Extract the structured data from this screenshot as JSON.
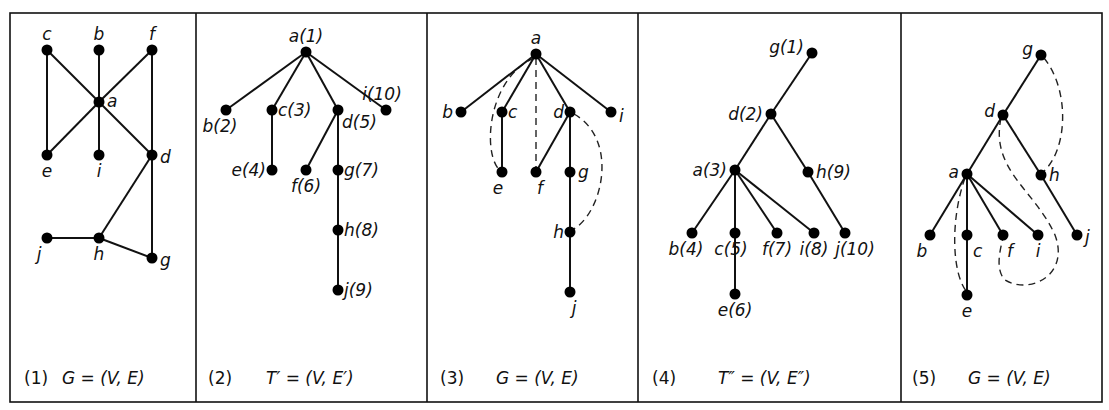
{
  "figure": {
    "panels": [
      {
        "id": "p1",
        "number": "(1)",
        "caption": "G = (V, E)",
        "type": "graph",
        "nodes": [
          {
            "id": "c",
            "label": "c",
            "x": 47,
            "y": 50
          },
          {
            "id": "b",
            "label": "b",
            "x": 99,
            "y": 50
          },
          {
            "id": "f",
            "label": "f",
            "x": 152,
            "y": 50
          },
          {
            "id": "a",
            "label": "a",
            "x": 99,
            "y": 102
          },
          {
            "id": "e",
            "label": "e",
            "x": 47,
            "y": 155
          },
          {
            "id": "i",
            "label": "i",
            "x": 99,
            "y": 155
          },
          {
            "id": "d",
            "label": "d",
            "x": 152,
            "y": 155
          },
          {
            "id": "j",
            "label": "j",
            "x": 47,
            "y": 238
          },
          {
            "id": "h",
            "label": "h",
            "x": 99,
            "y": 238
          },
          {
            "id": "g",
            "label": "g",
            "x": 152,
            "y": 258
          }
        ],
        "edges": [
          [
            "c",
            "a"
          ],
          [
            "c",
            "e"
          ],
          [
            "b",
            "a"
          ],
          [
            "a",
            "i"
          ],
          [
            "f",
            "a"
          ],
          [
            "f",
            "d"
          ],
          [
            "a",
            "e"
          ],
          [
            "a",
            "d"
          ],
          [
            "d",
            "h"
          ],
          [
            "d",
            "g"
          ],
          [
            "j",
            "h"
          ],
          [
            "h",
            "g"
          ]
        ]
      },
      {
        "id": "p2",
        "number": "(2)",
        "caption": "T′ = (V, E′)",
        "type": "spanning-tree",
        "nodes": [
          {
            "id": "a",
            "label": "a(1)",
            "x": 306,
            "y": 52
          },
          {
            "id": "b",
            "label": "b(2)",
            "x": 226,
            "y": 110
          },
          {
            "id": "c",
            "label": "c(3)",
            "x": 272,
            "y": 110
          },
          {
            "id": "d",
            "label": "d(5)",
            "x": 338,
            "y": 110
          },
          {
            "id": "i",
            "label": "i(10)",
            "x": 386,
            "y": 110
          },
          {
            "id": "e",
            "label": "e(4)",
            "x": 272,
            "y": 170
          },
          {
            "id": "f",
            "label": "f(6)",
            "x": 306,
            "y": 170
          },
          {
            "id": "g",
            "label": "g(7)",
            "x": 338,
            "y": 170
          },
          {
            "id": "h",
            "label": "h(8)",
            "x": 338,
            "y": 230
          },
          {
            "id": "j",
            "label": "j(9)",
            "x": 338,
            "y": 290
          }
        ],
        "edges": [
          [
            "a",
            "b"
          ],
          [
            "a",
            "c"
          ],
          [
            "a",
            "d"
          ],
          [
            "a",
            "i"
          ],
          [
            "c",
            "e"
          ],
          [
            "d",
            "f"
          ],
          [
            "d",
            "g"
          ],
          [
            "g",
            "h"
          ],
          [
            "h",
            "j"
          ]
        ]
      },
      {
        "id": "p3",
        "number": "(3)",
        "caption": "G = (V, E)",
        "type": "tree-with-back-edges",
        "nodes": [
          {
            "id": "a",
            "label": "a",
            "x": 536,
            "y": 54
          },
          {
            "id": "b",
            "label": "b",
            "x": 461,
            "y": 112
          },
          {
            "id": "c",
            "label": "c",
            "x": 502,
            "y": 112
          },
          {
            "id": "d",
            "label": "d",
            "x": 570,
            "y": 112
          },
          {
            "id": "i",
            "label": "i",
            "x": 611,
            "y": 112
          },
          {
            "id": "e",
            "label": "e",
            "x": 502,
            "y": 172
          },
          {
            "id": "f",
            "label": "f",
            "x": 536,
            "y": 172
          },
          {
            "id": "g",
            "label": "g",
            "x": 570,
            "y": 172
          },
          {
            "id": "h",
            "label": "h",
            "x": 570,
            "y": 232
          },
          {
            "id": "j",
            "label": "j",
            "x": 570,
            "y": 292
          }
        ],
        "edges": [
          [
            "a",
            "b"
          ],
          [
            "a",
            "c"
          ],
          [
            "a",
            "d"
          ],
          [
            "a",
            "i"
          ],
          [
            "c",
            "e"
          ],
          [
            "d",
            "f"
          ],
          [
            "d",
            "g"
          ],
          [
            "g",
            "h"
          ],
          [
            "h",
            "j"
          ]
        ],
        "dashed_edges": [
          [
            "a",
            "e"
          ],
          [
            "a",
            "f"
          ],
          [
            "d",
            "h"
          ]
        ]
      },
      {
        "id": "p4",
        "number": "(4)",
        "caption": "T″ = (V, E″)",
        "type": "spanning-tree",
        "nodes": [
          {
            "id": "g",
            "label": "g(1)",
            "x": 812,
            "y": 53
          },
          {
            "id": "d",
            "label": "d(2)",
            "x": 771,
            "y": 114
          },
          {
            "id": "a",
            "label": "a(3)",
            "x": 735,
            "y": 170
          },
          {
            "id": "h",
            "label": "h(9)",
            "x": 808,
            "y": 172
          },
          {
            "id": "b",
            "label": "b(4)",
            "x": 692,
            "y": 233
          },
          {
            "id": "c",
            "label": "c(5)",
            "x": 735,
            "y": 233
          },
          {
            "id": "f",
            "label": "f(7)",
            "x": 777,
            "y": 233
          },
          {
            "id": "i",
            "label": "i(8)",
            "x": 814,
            "y": 233
          },
          {
            "id": "j",
            "label": "j(10)",
            "x": 845,
            "y": 233
          },
          {
            "id": "e",
            "label": "e(6)",
            "x": 735,
            "y": 294
          }
        ],
        "edges": [
          [
            "g",
            "d"
          ],
          [
            "d",
            "a"
          ],
          [
            "d",
            "h"
          ],
          [
            "a",
            "b"
          ],
          [
            "a",
            "c"
          ],
          [
            "a",
            "f"
          ],
          [
            "a",
            "i"
          ],
          [
            "h",
            "j"
          ],
          [
            "c",
            "e"
          ]
        ]
      },
      {
        "id": "p5",
        "number": "(5)",
        "caption": "G = (V, E)",
        "type": "tree-with-back-edges",
        "nodes": [
          {
            "id": "g",
            "label": "g",
            "x": 1041,
            "y": 55
          },
          {
            "id": "d",
            "label": "d",
            "x": 1003,
            "y": 115
          },
          {
            "id": "a",
            "label": "a",
            "x": 967,
            "y": 174
          },
          {
            "id": "h",
            "label": "h",
            "x": 1041,
            "y": 175
          },
          {
            "id": "b",
            "label": "b",
            "x": 930,
            "y": 235
          },
          {
            "id": "c",
            "label": "c",
            "x": 967,
            "y": 235
          },
          {
            "id": "f",
            "label": "f",
            "x": 1003,
            "y": 235
          },
          {
            "id": "i",
            "label": "i",
            "x": 1038,
            "y": 235
          },
          {
            "id": "j",
            "label": "j",
            "x": 1077,
            "y": 235
          },
          {
            "id": "e",
            "label": "e",
            "x": 967,
            "y": 295
          }
        ],
        "edges": [
          [
            "g",
            "d"
          ],
          [
            "d",
            "a"
          ],
          [
            "d",
            "h"
          ],
          [
            "a",
            "b"
          ],
          [
            "a",
            "c"
          ],
          [
            "a",
            "f"
          ],
          [
            "a",
            "i"
          ],
          [
            "h",
            "j"
          ],
          [
            "c",
            "e"
          ]
        ],
        "dashed_edges": [
          [
            "g",
            "h"
          ],
          [
            "a",
            "e"
          ],
          [
            "d",
            "f"
          ]
        ]
      }
    ]
  }
}
